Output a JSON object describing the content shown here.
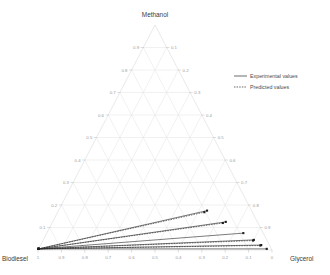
{
  "chart_data": {
    "type": "scatter",
    "title": "",
    "subtitle": "",
    "plot_kind": "ternary-phase-diagram",
    "vertices": {
      "top": "Methanol",
      "bottom_left": "Biodiesel",
      "bottom_right": "Glycerol"
    },
    "axes": {
      "left": {
        "name": "Methanol",
        "ticks": [
          "0.1",
          "0.2",
          "0.3",
          "0.4",
          "0.5",
          "0.6",
          "0.7",
          "0.8",
          "0.9"
        ],
        "direction": "ascending-upward"
      },
      "right": {
        "name": "Glycerol",
        "ticks": [
          "0.1",
          "0.2",
          "0.3",
          "0.4",
          "0.5",
          "0.6",
          "0.7",
          "0.8",
          "0.9"
        ],
        "direction": "descending-from-apex"
      },
      "bottom": {
        "name": "Biodiesel",
        "ticks": [
          "1",
          "0.9",
          "0.8",
          "0.7",
          "0.6",
          "0.5",
          "0.4",
          "0.3",
          "0.2",
          "0.1",
          "0"
        ],
        "direction": "descending-left-to-right"
      }
    },
    "grid": true,
    "grid_divisions": 10,
    "legend": {
      "position": "top-right",
      "entries": [
        {
          "label": "Experimental values",
          "style": "solid"
        },
        {
          "label": "Predicted values",
          "style": "dashed"
        }
      ]
    },
    "tie_lines": [
      {
        "id": "tie-1",
        "style": "solid",
        "series": "experimental",
        "start": {
          "biodiesel": 0.995,
          "methanol": 0.005,
          "glycerol": 0.0
        },
        "end": {
          "biodiesel": 0.19,
          "methanol": 0.175,
          "glycerol": 0.635
        }
      },
      {
        "id": "tie-1p",
        "style": "dashed",
        "series": "predicted",
        "start": {
          "biodiesel": 0.995,
          "methanol": 0.005,
          "glycerol": 0.0
        },
        "end": {
          "biodiesel": 0.205,
          "methanol": 0.168,
          "glycerol": 0.627
        }
      },
      {
        "id": "tie-2",
        "style": "solid",
        "series": "experimental",
        "start": {
          "biodiesel": 0.995,
          "methanol": 0.005,
          "glycerol": 0.0
        },
        "end": {
          "biodiesel": 0.135,
          "methanol": 0.125,
          "glycerol": 0.74
        }
      },
      {
        "id": "tie-2p",
        "style": "dashed",
        "series": "predicted",
        "start": {
          "biodiesel": 0.995,
          "methanol": 0.005,
          "glycerol": 0.0
        },
        "end": {
          "biodiesel": 0.15,
          "methanol": 0.12,
          "glycerol": 0.73
        }
      },
      {
        "id": "tie-3",
        "style": "solid",
        "series": "experimental",
        "start": {
          "biodiesel": 0.995,
          "methanol": 0.005,
          "glycerol": 0.0
        },
        "end": {
          "biodiesel": 0.085,
          "methanol": 0.075,
          "glycerol": 0.84
        }
      },
      {
        "id": "tie-4",
        "style": "solid",
        "series": "experimental",
        "start": {
          "biodiesel": 0.995,
          "methanol": 0.005,
          "glycerol": 0.0
        },
        "end": {
          "biodiesel": 0.055,
          "methanol": 0.045,
          "glycerol": 0.9
        }
      },
      {
        "id": "tie-4p",
        "style": "dashed",
        "series": "predicted",
        "start": {
          "biodiesel": 0.995,
          "methanol": 0.005,
          "glycerol": 0.0
        },
        "end": {
          "biodiesel": 0.06,
          "methanol": 0.042,
          "glycerol": 0.898
        }
      },
      {
        "id": "tie-5",
        "style": "solid",
        "series": "experimental",
        "start": {
          "biodiesel": 0.995,
          "methanol": 0.005,
          "glycerol": 0.0
        },
        "end": {
          "biodiesel": 0.035,
          "methanol": 0.022,
          "glycerol": 0.943
        }
      },
      {
        "id": "tie-5p",
        "style": "dashed",
        "series": "predicted",
        "start": {
          "biodiesel": 0.995,
          "methanol": 0.005,
          "glycerol": 0.0
        },
        "end": {
          "biodiesel": 0.04,
          "methanol": 0.02,
          "glycerol": 0.94
        }
      },
      {
        "id": "tie-6",
        "style": "solid",
        "series": "experimental",
        "start": {
          "biodiesel": 0.995,
          "methanol": 0.005,
          "glycerol": 0.0
        },
        "end": {
          "biodiesel": 0.02,
          "methanol": 0.005,
          "glycerol": 0.975
        }
      }
    ]
  }
}
